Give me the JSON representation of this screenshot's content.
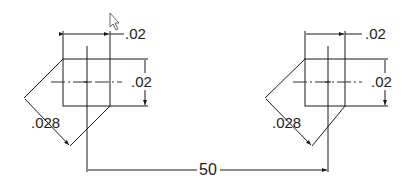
{
  "drawing": {
    "left_feature": {
      "width_dim": ".02",
      "height_dim": ".02",
      "diagonal_dim": ".028"
    },
    "right_feature": {
      "width_dim": ".02",
      "height_dim": ".02",
      "diagonal_dim": ".028"
    },
    "spacing_dim": "50"
  },
  "cursor": {
    "icon": "mouse-pointer-icon"
  },
  "colors": {
    "line": "#1a1a1a",
    "background": "#ffffff"
  }
}
